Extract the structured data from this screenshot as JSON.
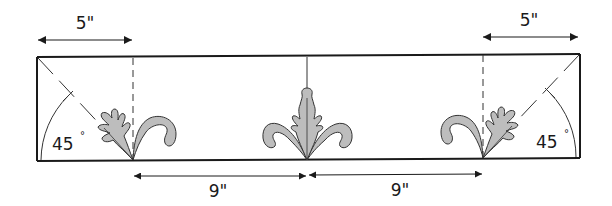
{
  "diagram": {
    "dimensions": {
      "left_corner_width": "5\"",
      "right_corner_width": "5\"",
      "left_spacing": "9\"",
      "right_spacing": "9\""
    },
    "angles": {
      "left_miter_angle": "45",
      "right_miter_angle": "45",
      "degree_symbol": "°"
    },
    "motifs": [
      "oak-leaf-with-curl-left",
      "fleur-center",
      "oak-leaf-with-curl-right"
    ],
    "colors": {
      "line": "#1a1a1a",
      "fill": "#bdbdbd",
      "dash": "#333333"
    }
  }
}
